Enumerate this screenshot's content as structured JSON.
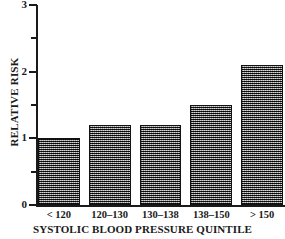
{
  "chart_data": {
    "type": "bar",
    "title": "",
    "subtitle": "",
    "xlabel": "SYSTOLIC BLOOD PRESSURE QUINTILE",
    "ylabel": "RELATIVE RISK",
    "categories": [
      "< 120",
      "120–130",
      "130–138",
      "138–150",
      "> 150"
    ],
    "values": [
      1.0,
      1.2,
      1.2,
      1.5,
      2.1
    ],
    "ylim": [
      0,
      3
    ],
    "y_major_ticks": [
      0,
      1,
      2,
      3
    ],
    "y_minor_ticks": [
      0.5,
      1.5,
      2.5
    ],
    "y_tick_labels": [
      "0",
      "1",
      "2",
      "3"
    ],
    "grid": false,
    "legend": null,
    "legend_position": "none",
    "bar_fill": "#6e6e6e",
    "bar_border": "#111111",
    "axis_color": "#1a1a1a",
    "background": "#ffffff"
  },
  "axes": {
    "y": {
      "title": "RELATIVE RISK",
      "ticks": [
        {
          "label": "3",
          "value": 3,
          "major": true
        },
        {
          "label": "",
          "value": 2.5,
          "major": false
        },
        {
          "label": "2",
          "value": 2,
          "major": true
        },
        {
          "label": "",
          "value": 1.5,
          "major": false
        },
        {
          "label": "1",
          "value": 1,
          "major": true
        },
        {
          "label": "",
          "value": 0.5,
          "major": false
        },
        {
          "label": "0",
          "value": 0,
          "major": true
        }
      ]
    },
    "x": {
      "title": "SYSTOLIC BLOOD PRESSURE QUINTILE",
      "ticks": [
        "< 120",
        "120–130",
        "130–138",
        "138–150",
        "> 150"
      ]
    }
  },
  "bars": [
    {
      "label": "< 120",
      "value": 1.0
    },
    {
      "label": "120–130",
      "value": 1.2
    },
    {
      "label": "130–138",
      "value": 1.2
    },
    {
      "label": "138–150",
      "value": 1.5
    },
    {
      "label": "> 150",
      "value": 2.1
    }
  ]
}
